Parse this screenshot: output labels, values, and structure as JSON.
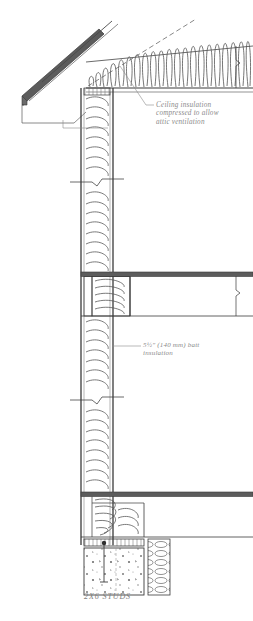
{
  "drawing": {
    "type": "architectural-section",
    "title": "Wall section detail",
    "background_color": "#ffffff",
    "line_color": "#3a3a3a",
    "hatch_color": "#6e6e6e",
    "text_color": "#8a8a8a",
    "width": 253,
    "height": 621
  },
  "annotations": {
    "ceiling": {
      "text": "Ceiling insulation\ncompressed to allow\nattic ventilation",
      "leader_from": [
        155,
        104
      ],
      "leader_to": [
        118,
        62
      ]
    },
    "batt": {
      "text": "5½\" (140 mm) batt\ninsulation",
      "leader_from": [
        141,
        345
      ],
      "leader_to": [
        104,
        345
      ]
    },
    "studs": {
      "text": "2X6 STUDS"
    }
  },
  "components": [
    {
      "name": "roof-rafter",
      "label": "Sloped roof rafter with sheathing"
    },
    {
      "name": "soffit",
      "label": "Eave soffit and fascia"
    },
    {
      "name": "attic-insulation",
      "label": "Attic batt insulation"
    },
    {
      "name": "exterior-wall",
      "label": "2x6 stud exterior wall cavity"
    },
    {
      "name": "wall-insulation",
      "label": "5½\" batt insulation in wall cavity"
    },
    {
      "name": "floor-assembly",
      "label": "Floor joist / rim board assembly"
    },
    {
      "name": "floor-insulation",
      "label": "Floor rim joist insulation"
    },
    {
      "name": "sill-plate",
      "label": "Sill plate on foundation"
    },
    {
      "name": "foundation-wall",
      "label": "Concrete foundation wall"
    },
    {
      "name": "anchor-bolt",
      "label": "Anchor bolt in sill plate"
    },
    {
      "name": "break-line",
      "label": "Drawing break symbol"
    }
  ]
}
